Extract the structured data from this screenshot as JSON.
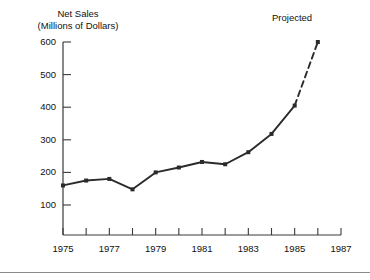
{
  "chart_data": {
    "type": "line",
    "title_line1": "Net Sales",
    "title_line2": "(Millions of Dollars)",
    "xlabel": "",
    "ylabel": "Net Sales (Millions of Dollars)",
    "xlim": [
      1975,
      1987
    ],
    "ylim": [
      0,
      600
    ],
    "grid": false,
    "legend": false,
    "line_color": "#2b2b2b",
    "marker": "square",
    "x": [
      1975,
      1976,
      1977,
      1978,
      1979,
      1980,
      1981,
      1982,
      1983,
      1984,
      1985,
      1986
    ],
    "values": [
      160,
      175,
      180,
      148,
      200,
      215,
      232,
      225,
      262,
      318,
      405,
      600
    ],
    "series": [
      {
        "name": "Actual",
        "style": "solid",
        "x": [
          1975,
          1976,
          1977,
          1978,
          1979,
          1980,
          1981,
          1982,
          1983,
          1984,
          1985
        ],
        "values": [
          160,
          175,
          180,
          148,
          200,
          215,
          232,
          225,
          262,
          318,
          405
        ]
      },
      {
        "name": "Projected",
        "style": "dashed",
        "x": [
          1985,
          1986
        ],
        "values": [
          405,
          600
        ]
      }
    ],
    "annotations": [
      {
        "text": "Projected",
        "x": 1986,
        "y": 600
      }
    ],
    "ytick_labels": [
      "100",
      "200",
      "300",
      "400",
      "500",
      "600"
    ],
    "ytick_values": [
      100,
      200,
      300,
      400,
      500,
      600
    ],
    "xtick_values": [
      1975,
      1976,
      1977,
      1978,
      1979,
      1980,
      1981,
      1982,
      1983,
      1984,
      1985,
      1986,
      1987
    ],
    "xtick_labels": [
      "1975",
      "",
      "1977",
      "",
      "1979",
      "",
      "1981",
      "",
      "1983",
      "",
      "1985",
      "",
      "1987"
    ],
    "xtick_labeled_values": [
      1975,
      1977,
      1979,
      1981,
      1983,
      1985,
      1987
    ],
    "xtick_labeled_text": [
      "1975",
      "1977",
      "1979",
      "1981",
      "1983",
      "1985",
      "1987"
    ]
  }
}
